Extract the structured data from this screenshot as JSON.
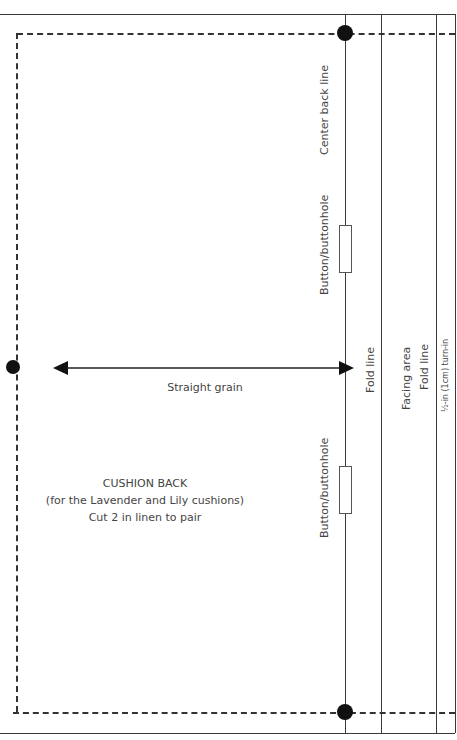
{
  "pattern": {
    "title": "CUSHION BACK",
    "subtitle": "(for the Lavender and Lily cushions)",
    "instruction": "Cut 2 in linen to pair",
    "grain_label": "Straight grain"
  },
  "vertical_labels": {
    "center_back": "Center back line",
    "buttonhole_top": "Button/buttonhole",
    "buttonhole_bottom": "Button/buttonhole",
    "fold_line_1": "Fold line",
    "facing_area": "Facing area",
    "fold_line_2": "Fold line",
    "turn_in": "½-in (1cm) turn-in"
  },
  "colors": {
    "line": "#3a3a3a",
    "dot": "#111111",
    "text": "#444444"
  }
}
